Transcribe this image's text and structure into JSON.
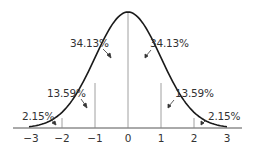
{
  "chart_data": {
    "type": "area",
    "xlabel": "",
    "ylabel": "",
    "x_ticks": [
      "−3",
      "−2",
      "−1",
      "0",
      "1",
      "2",
      "3"
    ],
    "x_range": [
      -3,
      3
    ],
    "grid": false,
    "legend": null,
    "segments": [
      {
        "from": -3,
        "to": -2,
        "percent": 2.15,
        "label": "2.15%"
      },
      {
        "from": -2,
        "to": -1,
        "percent": 13.59,
        "label": "13.59%"
      },
      {
        "from": -1,
        "to": 0,
        "percent": 34.13,
        "label": "34.13%"
      },
      {
        "from": 0,
        "to": 1,
        "percent": 34.13,
        "label": "34.13%"
      },
      {
        "from": 1,
        "to": 2,
        "percent": 13.59,
        "label": "13.59%"
      },
      {
        "from": 2,
        "to": 3,
        "percent": 2.15,
        "label": "2.15%"
      }
    ],
    "vertical_markers": [
      -2,
      -1,
      0,
      1,
      2
    ]
  },
  "labels": {
    "left_center": "34.13%",
    "right_center": "34.13%",
    "left_mid": "13.59%",
    "right_mid": "13.59%",
    "left_tail": "2.15%",
    "right_tail": "2.15%"
  },
  "ticks": {
    "t_m3": "−3",
    "t_m2": "−2",
    "t_m1": "−1",
    "t_0": "0",
    "t_1": "1",
    "t_2": "2",
    "t_3": "3"
  },
  "colors": {
    "curve": "#1a1a1a",
    "axis": "#555555",
    "marker": "#888888",
    "text": "#333333"
  }
}
